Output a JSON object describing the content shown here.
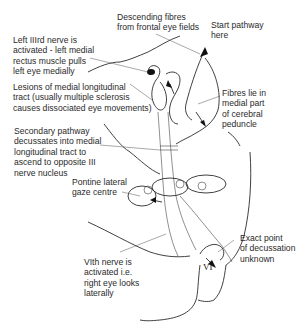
{
  "diagram": {
    "labels": {
      "descending_fibres": "Descending fibres\nfrom frontal eye fields",
      "start_pathway": "Start pathway\nhere",
      "left_third_nerve": "Left IIIrd nerve is\nactivated - left medial\nrectus muscle pulls\nleft eye medially",
      "lesions_mlf": "Lesions of medial longitudinal\ntract (usually multiple sclerosis\ncauses dissociated eye movements)",
      "fibres_medial": "Fibres lie in\nmedial part\nof cerebral\npeduncle",
      "secondary_pathway": "Secondary pathway\ndecussates into medial\nlongitudinal tract to\nascend to opposite III\nnerve nucleus",
      "pontine_gaze": "Pontine lateral\ngaze centre",
      "exact_point": "Exact point\nof decussation\nunknown",
      "sixth_nerve": "VIth nerve is\nactivated i.e.\nright eye looks\nlaterally",
      "vi_tag": "VI"
    },
    "colors": {
      "line": "#2b2b2b",
      "text": "#2a2a2a",
      "background": "#ffffff"
    }
  }
}
